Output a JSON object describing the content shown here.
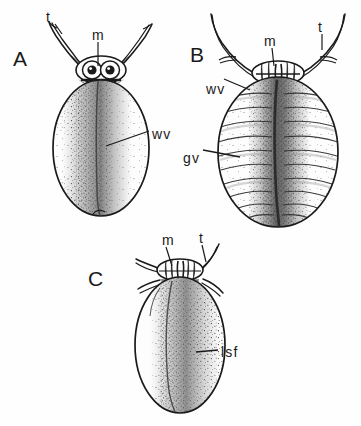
{
  "figure": {
    "kind": "scientific-line-illustration",
    "background_color": "#fefefe",
    "ink_color": "#1a1a1a",
    "width": 361,
    "height": 426
  },
  "panels": [
    {
      "id": "A",
      "letter": "A",
      "letter_pos": {
        "x": 13,
        "y": 48
      },
      "description": "dorsal view, unsegmented stippled ovoid body with median wax band",
      "labels": [
        {
          "key": "t",
          "text": "t",
          "x": 46,
          "y": 10
        },
        {
          "key": "m",
          "text": "m",
          "x": 92,
          "y": 28
        },
        {
          "key": "wv",
          "text": "wv",
          "x": 152,
          "y": 127
        }
      ]
    },
    {
      "id": "B",
      "letter": "B",
      "letter_pos": {
        "x": 190,
        "y": 44
      },
      "description": "dorsal view, transversely segmented body with median groove and long curving antennae",
      "labels": [
        {
          "key": "m",
          "text": "m",
          "x": 264,
          "y": 34
        },
        {
          "key": "t",
          "text": "t",
          "x": 318,
          "y": 20
        },
        {
          "key": "wv",
          "text": "wv",
          "x": 206,
          "y": 82
        },
        {
          "key": "gv",
          "text": "gv",
          "x": 183,
          "y": 151
        }
      ]
    },
    {
      "id": "C",
      "letter": "C",
      "letter_pos": {
        "x": 88,
        "y": 268
      },
      "description": "dorsal view, pyriform stippled body with longitudinal shield fold",
      "labels": [
        {
          "key": "m",
          "text": "m",
          "x": 162,
          "y": 233
        },
        {
          "key": "t",
          "text": "t",
          "x": 199,
          "y": 231
        },
        {
          "key": "lsf",
          "text": "lsf",
          "x": 221,
          "y": 345
        }
      ]
    }
  ],
  "legend_keys": {
    "t": "antenna / tarsus",
    "m": "mouthparts",
    "wv": "wax ventral band",
    "gv": "ventral groove",
    "lsf": "longitudinal shield fold"
  }
}
